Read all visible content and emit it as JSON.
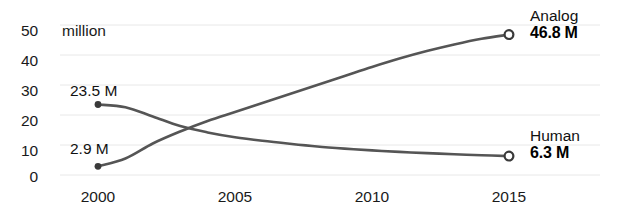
{
  "chart_data": {
    "type": "line",
    "title": "",
    "xlabel": "",
    "ylabel": "",
    "yunit_label": "million",
    "xlim": [
      2000,
      2015
    ],
    "ylim": [
      0,
      50
    ],
    "grid": true,
    "legend_position": "right-inline",
    "x_ticks": [
      "2000",
      "2005",
      "2010",
      "2015"
    ],
    "x_tick_values": [
      2000,
      2005,
      2010,
      2015
    ],
    "y_ticks": [
      "0",
      "10",
      "20",
      "30",
      "40",
      "50"
    ],
    "y_tick_values": [
      0,
      10,
      20,
      30,
      40,
      50
    ],
    "series": [
      {
        "name": "Analog",
        "start_label": "2.9 M",
        "end_label": "46.8 M",
        "start_value": 2.9,
        "end_value": 46.8,
        "color": "#555555",
        "x": [
          2000,
          2001,
          2002,
          2003,
          2004,
          2005,
          2006,
          2007,
          2008,
          2009,
          2010,
          2011,
          2012,
          2013,
          2014,
          2015
        ],
        "values": [
          2.9,
          5.5,
          10.5,
          14.5,
          18.0,
          21.0,
          24.0,
          27.0,
          30.0,
          33.0,
          36.0,
          38.8,
          41.3,
          43.5,
          45.4,
          46.8
        ]
      },
      {
        "name": "Human",
        "start_label": "23.5 M",
        "end_label": "6.3 M",
        "start_value": 23.5,
        "end_value": 6.3,
        "color": "#555555",
        "x": [
          2000,
          2001,
          2002,
          2003,
          2004,
          2005,
          2006,
          2007,
          2008,
          2009,
          2010,
          2011,
          2012,
          2013,
          2014,
          2015
        ],
        "values": [
          23.5,
          22.6,
          19.5,
          16.3,
          14.2,
          12.6,
          11.4,
          10.4,
          9.5,
          8.8,
          8.2,
          7.7,
          7.3,
          6.9,
          6.6,
          6.3
        ]
      }
    ]
  },
  "axis": {
    "y0": "0",
    "y10": "10",
    "y20": "20",
    "y30": "30",
    "y40": "40",
    "y50": "50",
    "unit": "million",
    "x0": "2000",
    "x1": "2005",
    "x2": "2010",
    "x3": "2015"
  },
  "annotations": {
    "analog_start": "2.9 M",
    "human_start": "23.5 M",
    "analog_name": "Analog",
    "analog_value": "46.8 M",
    "human_name": "Human",
    "human_value": "6.3 M"
  },
  "colors": {
    "line": "#555555",
    "grid": "#e8e8e8",
    "text": "#1a1a1a"
  }
}
